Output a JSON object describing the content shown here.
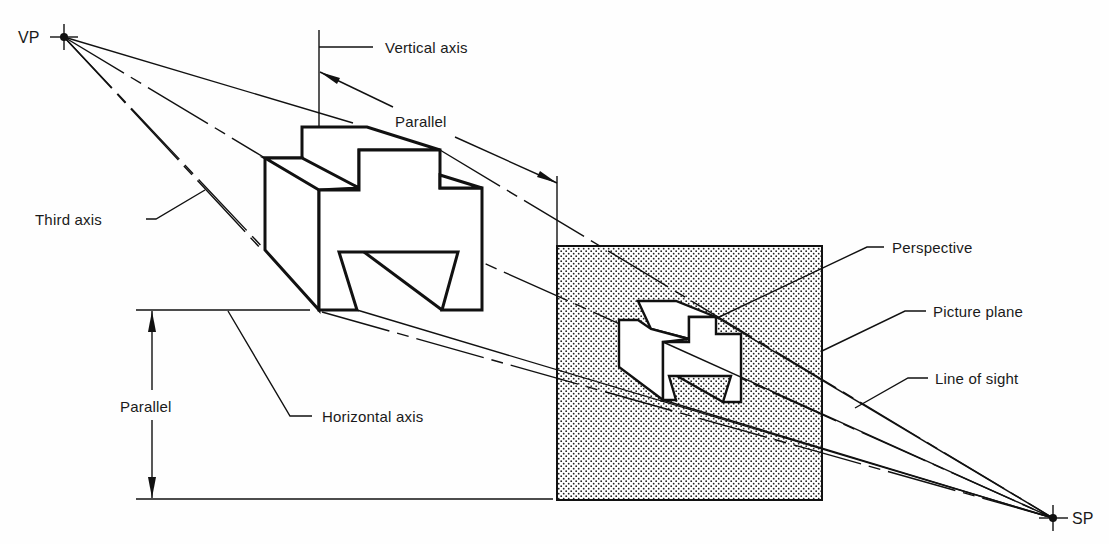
{
  "diagram": {
    "type": "perspective-projection",
    "points": {
      "vp": {
        "label": "VP",
        "x": 64,
        "y": 37
      },
      "sp": {
        "label": "SP",
        "x": 1053,
        "y": 518
      }
    },
    "labels": {
      "vertical_axis": "Vertical axis",
      "parallel_top": "Parallel",
      "third_axis": "Third axis",
      "perspective": "Perspective",
      "picture_plane": "Picture plane",
      "line_of_sight": "Line of sight",
      "parallel_left": "Parallel",
      "horizontal_axis": "Horizontal axis"
    },
    "picture_plane": {
      "x": 557,
      "y": 246,
      "width": 265,
      "height": 254,
      "fill": "#d8d8d8",
      "dot_color": "#222222"
    },
    "colors": {
      "ink": "#111111",
      "background": "#fefefe"
    }
  }
}
